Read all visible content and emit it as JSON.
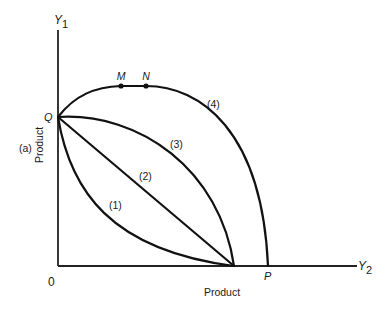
{
  "figure": {
    "panel_label": "(a)",
    "y_axis": {
      "name": "Y",
      "subscript": "1",
      "label": "Product"
    },
    "x_axis": {
      "name": "Y",
      "subscript": "2",
      "label": "Product"
    },
    "origin_label": "0",
    "points": {
      "Q": "Q",
      "P": "P",
      "M": "M",
      "N": "N"
    },
    "curves": [
      {
        "id": "1",
        "label": "(1)",
        "shape": "convex to origin"
      },
      {
        "id": "2",
        "label": "(2)",
        "shape": "straight line"
      },
      {
        "id": "3",
        "label": "(3)",
        "shape": "concave to origin"
      },
      {
        "id": "4",
        "label": "(4)",
        "shape": "concave, rising to flat segment M–N then falling to P"
      }
    ],
    "colors": {
      "ink": "#111111",
      "background": "#ffffff"
    }
  }
}
